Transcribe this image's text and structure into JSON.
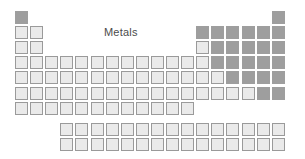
{
  "diagram": {
    "kind": "periodic-table-outline",
    "label": "Metals",
    "label_position": {
      "x": 104,
      "y": 27
    },
    "colors": {
      "metal_fill": "#eaeaea",
      "metal_border": "#9a9a9a",
      "nonmetal_fill": "#9e9e9e",
      "label_text": "#4b4b4b",
      "background": "#ffffff"
    },
    "grid": {
      "columns": 18,
      "periods": 7,
      "cell_size": 13,
      "cell_pitch": 15.1,
      "origin_x": 15,
      "origin_y": 11,
      "inner_block_gap": 6,
      "inner_block_start_column": 4,
      "inner_block_columns": 15
    },
    "legend": [
      {
        "key": "metal",
        "style": "light-outline",
        "meaning": "Metals"
      },
      {
        "key": "nonmetal",
        "style": "solid-gray",
        "meaning": "Nonmetals"
      }
    ],
    "cells": [
      {
        "col": 1,
        "period": 1,
        "type": "nonmetal"
      },
      {
        "col": 18,
        "period": 1,
        "type": "nonmetal"
      },
      {
        "col": 1,
        "period": 2,
        "type": "metal"
      },
      {
        "col": 2,
        "period": 2,
        "type": "metal"
      },
      {
        "col": 13,
        "period": 2,
        "type": "nonmetal"
      },
      {
        "col": 14,
        "period": 2,
        "type": "nonmetal"
      },
      {
        "col": 15,
        "period": 2,
        "type": "nonmetal"
      },
      {
        "col": 16,
        "period": 2,
        "type": "nonmetal"
      },
      {
        "col": 17,
        "period": 2,
        "type": "nonmetal"
      },
      {
        "col": 18,
        "period": 2,
        "type": "nonmetal"
      },
      {
        "col": 1,
        "period": 3,
        "type": "metal"
      },
      {
        "col": 2,
        "period": 3,
        "type": "metal"
      },
      {
        "col": 13,
        "period": 3,
        "type": "metal"
      },
      {
        "col": 14,
        "period": 3,
        "type": "nonmetal"
      },
      {
        "col": 15,
        "period": 3,
        "type": "nonmetal"
      },
      {
        "col": 16,
        "period": 3,
        "type": "nonmetal"
      },
      {
        "col": 17,
        "period": 3,
        "type": "nonmetal"
      },
      {
        "col": 18,
        "period": 3,
        "type": "nonmetal"
      },
      {
        "col": 1,
        "period": 4,
        "type": "metal"
      },
      {
        "col": 2,
        "period": 4,
        "type": "metal"
      },
      {
        "col": 3,
        "period": 4,
        "type": "metal"
      },
      {
        "col": 4,
        "period": 4,
        "type": "metal"
      },
      {
        "col": 5,
        "period": 4,
        "type": "metal"
      },
      {
        "col": 6,
        "period": 4,
        "type": "metal"
      },
      {
        "col": 7,
        "period": 4,
        "type": "metal"
      },
      {
        "col": 8,
        "period": 4,
        "type": "metal"
      },
      {
        "col": 9,
        "period": 4,
        "type": "metal"
      },
      {
        "col": 10,
        "period": 4,
        "type": "metal"
      },
      {
        "col": 11,
        "period": 4,
        "type": "metal"
      },
      {
        "col": 12,
        "period": 4,
        "type": "metal"
      },
      {
        "col": 13,
        "period": 4,
        "type": "metal"
      },
      {
        "col": 14,
        "period": 4,
        "type": "nonmetal"
      },
      {
        "col": 15,
        "period": 4,
        "type": "nonmetal"
      },
      {
        "col": 16,
        "period": 4,
        "type": "nonmetal"
      },
      {
        "col": 17,
        "period": 4,
        "type": "nonmetal"
      },
      {
        "col": 18,
        "period": 4,
        "type": "nonmetal"
      },
      {
        "col": 1,
        "period": 5,
        "type": "metal"
      },
      {
        "col": 2,
        "period": 5,
        "type": "metal"
      },
      {
        "col": 3,
        "period": 5,
        "type": "metal"
      },
      {
        "col": 4,
        "period": 5,
        "type": "metal"
      },
      {
        "col": 5,
        "period": 5,
        "type": "metal"
      },
      {
        "col": 6,
        "period": 5,
        "type": "metal"
      },
      {
        "col": 7,
        "period": 5,
        "type": "metal"
      },
      {
        "col": 8,
        "period": 5,
        "type": "metal"
      },
      {
        "col": 9,
        "period": 5,
        "type": "metal"
      },
      {
        "col": 10,
        "period": 5,
        "type": "metal"
      },
      {
        "col": 11,
        "period": 5,
        "type": "metal"
      },
      {
        "col": 12,
        "period": 5,
        "type": "metal"
      },
      {
        "col": 13,
        "period": 5,
        "type": "metal"
      },
      {
        "col": 14,
        "period": 5,
        "type": "metal"
      },
      {
        "col": 15,
        "period": 5,
        "type": "nonmetal"
      },
      {
        "col": 16,
        "period": 5,
        "type": "nonmetal"
      },
      {
        "col": 17,
        "period": 5,
        "type": "nonmetal"
      },
      {
        "col": 18,
        "period": 5,
        "type": "nonmetal"
      },
      {
        "col": 1,
        "period": 6,
        "type": "metal"
      },
      {
        "col": 2,
        "period": 6,
        "type": "metal"
      },
      {
        "col": 3,
        "period": 6,
        "type": "metal"
      },
      {
        "col": 4,
        "period": 6,
        "type": "metal"
      },
      {
        "col": 5,
        "period": 6,
        "type": "metal"
      },
      {
        "col": 6,
        "period": 6,
        "type": "metal"
      },
      {
        "col": 7,
        "period": 6,
        "type": "metal"
      },
      {
        "col": 8,
        "period": 6,
        "type": "metal"
      },
      {
        "col": 9,
        "period": 6,
        "type": "metal"
      },
      {
        "col": 10,
        "period": 6,
        "type": "metal"
      },
      {
        "col": 11,
        "period": 6,
        "type": "metal"
      },
      {
        "col": 12,
        "period": 6,
        "type": "metal"
      },
      {
        "col": 13,
        "period": 6,
        "type": "metal"
      },
      {
        "col": 14,
        "period": 6,
        "type": "metal"
      },
      {
        "col": 15,
        "period": 6,
        "type": "metal"
      },
      {
        "col": 16,
        "period": 6,
        "type": "metal"
      },
      {
        "col": 17,
        "period": 6,
        "type": "nonmetal"
      },
      {
        "col": 18,
        "period": 6,
        "type": "nonmetal"
      },
      {
        "col": 1,
        "period": 7,
        "type": "metal"
      },
      {
        "col": 2,
        "period": 7,
        "type": "metal"
      },
      {
        "col": 3,
        "period": 7,
        "type": "metal"
      },
      {
        "col": 4,
        "period": 7,
        "type": "metal"
      },
      {
        "col": 5,
        "period": 7,
        "type": "metal"
      },
      {
        "col": 6,
        "period": 7,
        "type": "metal"
      },
      {
        "col": 7,
        "period": 7,
        "type": "metal"
      },
      {
        "col": 8,
        "period": 7,
        "type": "metal"
      },
      {
        "col": 9,
        "period": 7,
        "type": "metal"
      },
      {
        "col": 10,
        "period": 7,
        "type": "metal"
      },
      {
        "col": 11,
        "period": 7,
        "type": "metal"
      },
      {
        "col": 12,
        "period": 7,
        "type": "metal"
      }
    ],
    "inner_rows": [
      {
        "name": "lanthanides",
        "row": 1,
        "cells": [
          {
            "index": 1,
            "type": "metal"
          },
          {
            "index": 2,
            "type": "metal"
          },
          {
            "index": 3,
            "type": "metal"
          },
          {
            "index": 4,
            "type": "metal"
          },
          {
            "index": 5,
            "type": "metal"
          },
          {
            "index": 6,
            "type": "metal"
          },
          {
            "index": 7,
            "type": "metal"
          },
          {
            "index": 8,
            "type": "metal"
          },
          {
            "index": 9,
            "type": "metal"
          },
          {
            "index": 10,
            "type": "metal"
          },
          {
            "index": 11,
            "type": "metal"
          },
          {
            "index": 12,
            "type": "metal"
          },
          {
            "index": 13,
            "type": "metal"
          },
          {
            "index": 14,
            "type": "metal"
          },
          {
            "index": 15,
            "type": "metal"
          }
        ]
      },
      {
        "name": "actinides",
        "row": 2,
        "cells": [
          {
            "index": 1,
            "type": "metal"
          },
          {
            "index": 2,
            "type": "metal"
          },
          {
            "index": 3,
            "type": "metal"
          },
          {
            "index": 4,
            "type": "metal"
          },
          {
            "index": 5,
            "type": "metal"
          },
          {
            "index": 6,
            "type": "metal"
          },
          {
            "index": 7,
            "type": "metal"
          },
          {
            "index": 8,
            "type": "metal"
          },
          {
            "index": 9,
            "type": "metal"
          },
          {
            "index": 10,
            "type": "metal"
          },
          {
            "index": 11,
            "type": "metal"
          },
          {
            "index": 12,
            "type": "metal"
          },
          {
            "index": 13,
            "type": "metal"
          },
          {
            "index": 14,
            "type": "metal"
          },
          {
            "index": 15,
            "type": "metal"
          }
        ]
      }
    ]
  }
}
